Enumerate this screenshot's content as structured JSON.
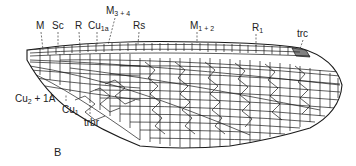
{
  "figure": {
    "panel_label": "B",
    "line_color": "#1a1a1a",
    "background": "#ffffff"
  },
  "labels": {
    "top": [
      {
        "id": "M",
        "base": "M",
        "sub": "",
        "x": 38,
        "y": 20
      },
      {
        "id": "Sc",
        "base": "Sc",
        "sub": "",
        "x": 54,
        "y": 20
      },
      {
        "id": "R",
        "base": "R",
        "sub": "",
        "x": 75,
        "y": 20
      },
      {
        "id": "Cu1a",
        "base": "Cu",
        "sub": "1a",
        "x": 89,
        "y": 20
      },
      {
        "id": "M34",
        "base": "M",
        "sub": "3 + 4",
        "x": 106,
        "y": 6
      },
      {
        "id": "Rs",
        "base": "Rs",
        "sub": "",
        "x": 134,
        "y": 20
      },
      {
        "id": "M12",
        "base": "M",
        "sub": "1 + 2",
        "x": 190,
        "y": 20
      },
      {
        "id": "R1",
        "base": "R",
        "sub": "1",
        "x": 252,
        "y": 22
      },
      {
        "id": "trc",
        "base": "trc",
        "sub": "",
        "x": 299,
        "y": 28
      }
    ],
    "bottom": [
      {
        "id": "Cu21A",
        "base": "Cu",
        "sub": "2",
        "suffix": " + 1A",
        "x": 16,
        "y": 90
      },
      {
        "id": "Cu1",
        "base": "Cu",
        "sub": "1",
        "x": 63,
        "y": 103
      },
      {
        "id": "trbr",
        "base": "trbr",
        "sub": "",
        "x": 85,
        "y": 117
      }
    ]
  }
}
